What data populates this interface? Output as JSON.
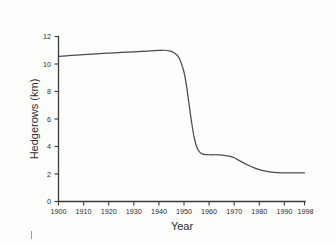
{
  "figure": {
    "background_color": "#fdfdfc",
    "ink_color": "#3a3a3a",
    "curve_color": "#4a4a4a"
  },
  "chart_data": {
    "type": "line",
    "title": "",
    "subtitle": "",
    "xlabel": "Year",
    "ylabel": "Hedgerows (km)",
    "xlim": [
      1900,
      1998
    ],
    "ylim": [
      0,
      12
    ],
    "grid": false,
    "legend": "none",
    "xticks": [
      1900,
      1910,
      1920,
      1930,
      1940,
      1950,
      1960,
      1970,
      1980,
      1990,
      1998
    ],
    "xtick_labels": [
      "1900",
      "1910",
      "1920",
      "1930",
      "1940",
      "1950",
      "1960",
      "1970",
      "1980",
      "1990",
      "1998"
    ],
    "yticks": [
      0,
      2,
      4,
      6,
      8,
      10,
      12
    ],
    "ytick_labels": [
      "0",
      "2",
      "4",
      "6",
      "8",
      "10",
      "12"
    ],
    "series": [
      {
        "name": "Hedgerows",
        "x": [
          1900,
          1905,
          1910,
          1915,
          1920,
          1925,
          1930,
          1935,
          1940,
          1942,
          1944,
          1946,
          1948,
          1950,
          1951,
          1952,
          1953,
          1954,
          1955,
          1956,
          1957,
          1958,
          1960,
          1962,
          1964,
          1966,
          1968,
          1970,
          1972,
          1974,
          1976,
          1978,
          1980,
          1982,
          1984,
          1986,
          1988,
          1990,
          1992,
          1994,
          1996,
          1998
        ],
        "y": [
          10.55,
          10.62,
          10.68,
          10.74,
          10.79,
          10.84,
          10.89,
          10.94,
          10.99,
          11.0,
          10.96,
          10.82,
          10.45,
          9.4,
          8.4,
          7.1,
          5.8,
          4.7,
          4.0,
          3.65,
          3.48,
          3.42,
          3.4,
          3.4,
          3.39,
          3.36,
          3.3,
          3.18,
          2.98,
          2.78,
          2.6,
          2.45,
          2.32,
          2.22,
          2.15,
          2.11,
          2.09,
          2.08,
          2.08,
          2.08,
          2.08,
          2.08
        ]
      }
    ],
    "annotations": []
  }
}
